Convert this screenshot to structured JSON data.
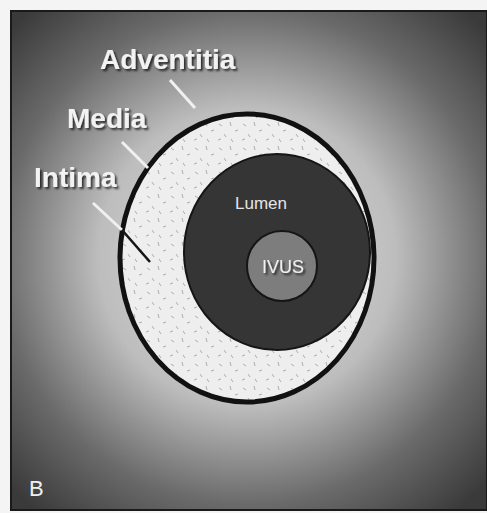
{
  "figure": {
    "panel_letter": "B",
    "labels": {
      "adventitia": "Adventitia",
      "media": "Media",
      "intima": "Intima",
      "lumen": "Lumen",
      "ivus": "IVUS"
    },
    "colors": {
      "background_center": "#d8d8d8",
      "background_edge": "#3a3a3a",
      "vessel_wall": "#eeeeee",
      "wall_outline": "#111111",
      "lumen": "#333333",
      "ivus_catheter": "#7a7a7a",
      "label_text": "#f2f2f2"
    }
  }
}
